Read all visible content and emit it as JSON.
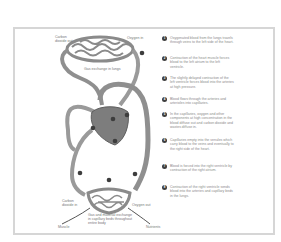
{
  "diagram": {
    "type": "circulatory-system",
    "labels": {
      "co2_out": "Carbon dioxide out",
      "o2_in": "Oxygen in",
      "lung_exchange": "Gas exchange in lungs",
      "co2_in": "Carbon dioxide in",
      "o2_out": "Oxygen out",
      "body_exchange": "Gas and material exchange in capillary beds throughout entire body",
      "muscle": "Muscle",
      "nutrients": "Nutrients"
    },
    "markers": [
      "1",
      "2",
      "3",
      "4",
      "5",
      "6",
      "7",
      "8"
    ],
    "colors": {
      "vessel": "#9a9a9a",
      "vessel_dark": "#6e6e6e",
      "heart": "#7a7a7a",
      "badge": "#3d3d3d",
      "frame": "#d6d6d6"
    }
  },
  "steps": [
    {
      "num": "1",
      "text": "Oxygenated blood from the lungs travels through veins to the left side of the heart."
    },
    {
      "num": "2",
      "text": "Contraction of the heart muscle forces blood to the left atrium to the left ventricle."
    },
    {
      "num": "3",
      "text": "The slightly delayed contraction of the left ventricle forces blood into the arteries at high pressure."
    },
    {
      "num": "4",
      "text": "Blood flows through the arteries and arterioles into capillaries."
    },
    {
      "num": "5",
      "text": "In the capillaries, oxygen and other components at high concentration in the blood diffuse out and carbon dioxide and wastes diffuse in."
    },
    {
      "num": "6",
      "text": "Capillaries empty into the venules which carry blood to the veins and eventually to the right side of the heart."
    },
    {
      "num": "7",
      "text": "Blood is forced into the right ventricle by contraction of the right atrium."
    },
    {
      "num": "8",
      "text": "Contraction of the right ventricle sends blood into the arteries and capillary beds in the lungs."
    }
  ]
}
